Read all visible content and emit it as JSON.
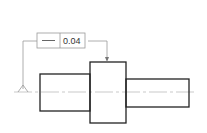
{
  "drawing": {
    "feature_control_frame": {
      "symbol": "straightness-icon",
      "tolerance": "0.04"
    },
    "colors": {
      "part_outline": "#222222",
      "annotation": "#999999",
      "centerline": "#bbbbbb"
    }
  }
}
